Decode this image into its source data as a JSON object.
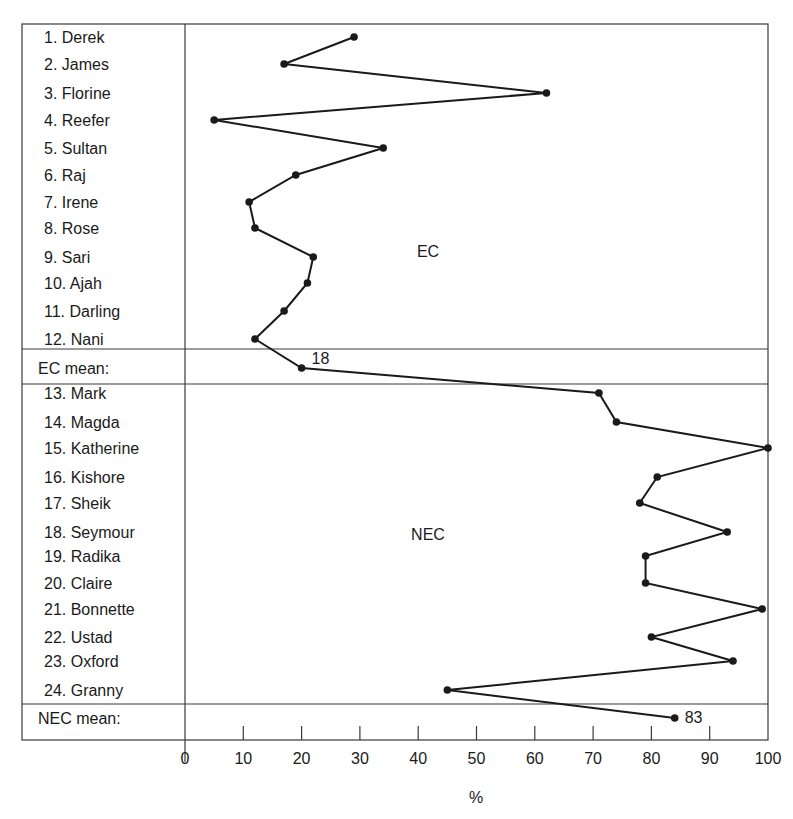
{
  "chart_data": {
    "type": "line",
    "orientation": "horizontal-values-vertical-categories",
    "title": "",
    "xlabel": "%",
    "ylabel": "",
    "xlim": [
      0,
      100
    ],
    "x_ticks": [
      0,
      10,
      20,
      30,
      40,
      50,
      60,
      70,
      80,
      90,
      100
    ],
    "grid": false,
    "legend": null,
    "groups": [
      {
        "name": "EC",
        "categories": [
          "1. Derek",
          "2. James",
          "3. Florine",
          "4. Reefer",
          "5. Sultan",
          "6. Raj",
          "7. Irene",
          "8. Rose",
          "9. Sari",
          "10. Ajah",
          "11. Darling",
          "12. Nani"
        ],
        "values": [
          29,
          17,
          62,
          5,
          34,
          19,
          11,
          12,
          22,
          21,
          17,
          12
        ],
        "mean_label": "EC mean:",
        "mean_value": 18,
        "mean_plotted": 20,
        "mean_annotation": "18"
      },
      {
        "name": "NEC",
        "categories": [
          "13. Mark",
          "14. Magda",
          "15. Katherine",
          "16. Kishore",
          "17. Sheik",
          "18. Seymour",
          "19. Radika",
          "20. Claire",
          "21. Bonnette",
          "22. Ustad",
          "23. Oxford",
          "24. Granny"
        ],
        "values": [
          71,
          74,
          100,
          81,
          78,
          93,
          79,
          79,
          99,
          80,
          94,
          45
        ],
        "mean_label": "NEC mean:",
        "mean_value": 83,
        "mean_plotted": 84,
        "mean_annotation": "83"
      }
    ],
    "annotations": [
      "EC",
      "NEC",
      "18",
      "83"
    ]
  },
  "layout": {
    "frame": {
      "left": 22,
      "top": 24,
      "right": 768,
      "bottom": 740,
      "divider_x": 185
    },
    "x_scale": {
      "x0": 185,
      "x100": 768
    },
    "row_y": {
      "EC": [
        37,
        64,
        93,
        120,
        148,
        175,
        202,
        228,
        257,
        283,
        311,
        339
      ],
      "EC_mean": 368,
      "NEC": [
        393,
        422,
        448,
        477,
        503,
        532,
        556,
        583,
        609,
        637,
        661,
        690
      ],
      "NEC_mean": 718
    },
    "hlines": [
      349,
      384,
      704
    ],
    "group_label_pos": {
      "EC": [
        428,
        257
      ],
      "NEC": [
        428,
        540
      ]
    },
    "line_color": "#1a1a1a",
    "frame_color": "#3a3a3a"
  }
}
